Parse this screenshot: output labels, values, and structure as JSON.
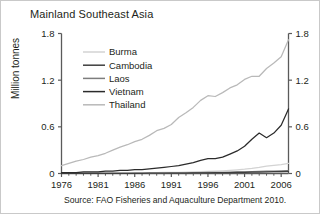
{
  "figure": {
    "title": "Mainland Southeast Asia",
    "y_axis_title": "Million tonnes",
    "source": "Source: FAO Fisheries and Aquaculture Department 2010."
  },
  "axis": {
    "y_ticks_left": [
      "1.8",
      "1.2",
      "0.6",
      "0"
    ],
    "y_ticks_right": [
      "1.8",
      "1.2",
      "0.6",
      "0"
    ],
    "x_ticks": [
      "1976",
      "1981",
      "1986",
      "1991",
      "1996",
      "2001",
      "2006"
    ]
  },
  "legend": {
    "items": [
      {
        "label": "Burma",
        "color": "#d3d3d3"
      },
      {
        "label": "Cambodia",
        "color": "#3f3f3f"
      },
      {
        "label": "Laos",
        "color": "#7d7d7d"
      },
      {
        "label": "Vietnam",
        "color": "#2b2b2b"
      },
      {
        "label": "Thailand",
        "color": "#b9b9b9"
      }
    ]
  },
  "colors": {
    "axis": "#5a5a5a",
    "frame": "#c9c9c9",
    "text": "#231f20"
  },
  "chart_data": {
    "type": "line",
    "title": "Mainland Southeast Asia",
    "xlabel": "",
    "ylabel": "Million tonnes",
    "xlim": [
      1976,
      2007
    ],
    "ylim": [
      0,
      1.8
    ],
    "grid": false,
    "legend_position": "upper-left-inside",
    "x": [
      1976,
      1977,
      1978,
      1979,
      1980,
      1981,
      1982,
      1983,
      1984,
      1985,
      1986,
      1987,
      1988,
      1989,
      1990,
      1991,
      1992,
      1993,
      1994,
      1995,
      1996,
      1997,
      1998,
      1999,
      2000,
      2001,
      2002,
      2003,
      2004,
      2005,
      2006,
      2007
    ],
    "series": [
      {
        "name": "Thailand",
        "color": "#b9b9b9",
        "values": [
          0.1,
          0.13,
          0.16,
          0.18,
          0.21,
          0.23,
          0.26,
          0.3,
          0.34,
          0.37,
          0.41,
          0.44,
          0.49,
          0.55,
          0.58,
          0.63,
          0.72,
          0.78,
          0.85,
          0.94,
          1.0,
          0.99,
          1.04,
          1.1,
          1.14,
          1.21,
          1.25,
          1.25,
          1.35,
          1.42,
          1.5,
          1.72
        ]
      },
      {
        "name": "Vietnam",
        "color": "#2b2b2b",
        "values": [
          0.01,
          0.01,
          0.01,
          0.02,
          0.02,
          0.02,
          0.03,
          0.03,
          0.04,
          0.04,
          0.05,
          0.05,
          0.06,
          0.07,
          0.08,
          0.09,
          0.1,
          0.12,
          0.14,
          0.17,
          0.19,
          0.19,
          0.21,
          0.25,
          0.29,
          0.35,
          0.44,
          0.52,
          0.46,
          0.52,
          0.62,
          0.83
        ]
      },
      {
        "name": "Burma",
        "color": "#d3d3d3",
        "values": [
          0.003,
          0.004,
          0.004,
          0.005,
          0.005,
          0.006,
          0.006,
          0.007,
          0.008,
          0.008,
          0.009,
          0.01,
          0.011,
          0.012,
          0.013,
          0.014,
          0.016,
          0.018,
          0.02,
          0.023,
          0.027,
          0.03,
          0.035,
          0.041,
          0.048,
          0.055,
          0.065,
          0.078,
          0.095,
          0.105,
          0.115,
          0.13
        ]
      },
      {
        "name": "Laos",
        "color": "#7d7d7d",
        "values": [
          0.001,
          0.001,
          0.001,
          0.001,
          0.002,
          0.002,
          0.002,
          0.002,
          0.003,
          0.003,
          0.004,
          0.004,
          0.005,
          0.005,
          0.006,
          0.007,
          0.008,
          0.009,
          0.01,
          0.011,
          0.013,
          0.014,
          0.016,
          0.018,
          0.02,
          0.022,
          0.025,
          0.027,
          0.03,
          0.032,
          0.035,
          0.038
        ]
      },
      {
        "name": "Cambodia",
        "color": "#3f3f3f",
        "values": [
          0.001,
          0.001,
          0.001,
          0.001,
          0.001,
          0.002,
          0.002,
          0.002,
          0.002,
          0.003,
          0.003,
          0.003,
          0.004,
          0.004,
          0.005,
          0.005,
          0.006,
          0.006,
          0.007,
          0.008,
          0.009,
          0.01,
          0.011,
          0.012,
          0.013,
          0.015,
          0.017,
          0.019,
          0.021,
          0.023,
          0.025,
          0.028
        ]
      }
    ]
  }
}
